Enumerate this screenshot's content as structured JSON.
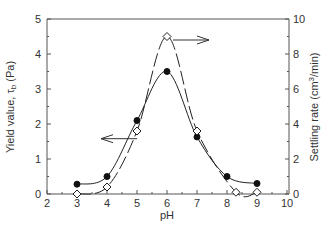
{
  "chart_data": {
    "type": "line",
    "title": "",
    "xlabel": "pH",
    "ylabel": "Yield value, τb (Pa)",
    "y2label": "Settling rate (cm³/min)",
    "xlim": [
      2,
      10
    ],
    "ylim": [
      0,
      5
    ],
    "y2lim": [
      0,
      10
    ],
    "x_ticks": [
      2,
      3,
      4,
      5,
      6,
      7,
      8,
      9,
      10
    ],
    "y_ticks": [
      0,
      1,
      2,
      3,
      4,
      5
    ],
    "y2_ticks": [
      0,
      2,
      4,
      6,
      8,
      10
    ],
    "grid": false,
    "legend": null,
    "series": [
      {
        "name": "Yield value",
        "axis": "left",
        "marker": "filled-circle",
        "line": "solid",
        "x": [
          3,
          4,
          5,
          6,
          7,
          8,
          9
        ],
        "values": [
          0.28,
          0.5,
          2.1,
          3.5,
          1.63,
          0.5,
          0.3
        ]
      },
      {
        "name": "Settling rate",
        "axis": "right",
        "marker": "open-diamond",
        "line": "dashed",
        "x": [
          3,
          4,
          5,
          6,
          7,
          8.3,
          9
        ],
        "values": [
          0,
          0.4,
          3.6,
          9.0,
          3.6,
          0.1,
          0.1
        ]
      }
    ],
    "annotations": [
      {
        "type": "arrow",
        "direction": "left",
        "from_pH": 5.0,
        "level": 1.58,
        "meaning": "yield value series uses left axis"
      },
      {
        "type": "arrow",
        "direction": "right",
        "from_pH": 6.2,
        "level": 4.4,
        "meaning": "settling rate series uses right axis"
      }
    ]
  }
}
